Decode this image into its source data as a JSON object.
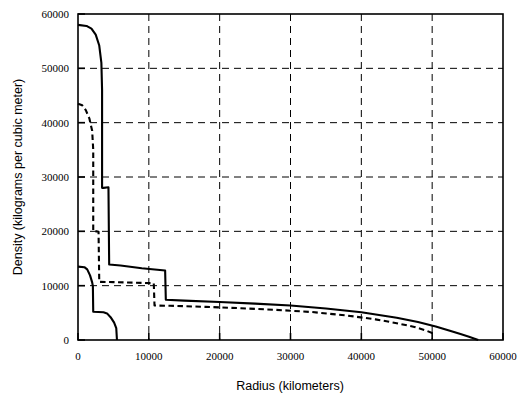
{
  "chart_data": {
    "type": "line",
    "title": "",
    "xlabel": "Radius (kilometers)",
    "ylabel": "Density  (kilograms per cubic meter)",
    "xlim": [
      0,
      60000
    ],
    "ylim": [
      0,
      60000
    ],
    "xticks": [
      0,
      10000,
      20000,
      30000,
      40000,
      50000,
      60000
    ],
    "yticks": [
      0,
      10000,
      20000,
      30000,
      40000,
      50000,
      60000
    ],
    "xtick_labels": [
      "0",
      "10000",
      "20000",
      "30000",
      "40000",
      "50000",
      "60000"
    ],
    "ytick_labels": [
      "0",
      "10000",
      "20000",
      "30000",
      "40000",
      "50000",
      "60000"
    ],
    "grid": true,
    "grid_style": "dashed",
    "legend": "none",
    "series": [
      {
        "name": "solid-upper",
        "style": "solid",
        "color": "#000000",
        "points": [
          [
            0,
            58000
          ],
          [
            1200,
            57800
          ],
          [
            1900,
            57300
          ],
          [
            2500,
            56200
          ],
          [
            3000,
            54200
          ],
          [
            3300,
            51000
          ],
          [
            3400,
            46000
          ],
          [
            3400,
            28000
          ],
          [
            3600,
            28000
          ],
          [
            4300,
            28100
          ],
          [
            4400,
            13900
          ],
          [
            6000,
            13700
          ],
          [
            9000,
            13200
          ],
          [
            12300,
            12800
          ],
          [
            12400,
            7400
          ],
          [
            15000,
            7250
          ],
          [
            20000,
            7000
          ],
          [
            25000,
            6700
          ],
          [
            30000,
            6350
          ],
          [
            35000,
            5800
          ],
          [
            40000,
            5100
          ],
          [
            45000,
            4100
          ],
          [
            48000,
            3300
          ],
          [
            50500,
            2500
          ],
          [
            52500,
            1700
          ],
          [
            54000,
            1100
          ],
          [
            55200,
            600
          ],
          [
            56000,
            250
          ],
          [
            56400,
            60
          ],
          [
            56500,
            0
          ]
        ]
      },
      {
        "name": "dashed-middle",
        "style": "dashed",
        "color": "#000000",
        "points": [
          [
            0,
            43500
          ],
          [
            600,
            43200
          ],
          [
            1100,
            42300
          ],
          [
            1600,
            40800
          ],
          [
            2000,
            38500
          ],
          [
            2150,
            35000
          ],
          [
            2150,
            20000
          ],
          [
            2600,
            20000
          ],
          [
            2900,
            19900
          ],
          [
            3000,
            10700
          ],
          [
            5000,
            10650
          ],
          [
            8000,
            10550
          ],
          [
            10700,
            10450
          ],
          [
            10800,
            6350
          ],
          [
            13000,
            6300
          ],
          [
            18000,
            6100
          ],
          [
            23000,
            5850
          ],
          [
            28000,
            5550
          ],
          [
            33000,
            5150
          ],
          [
            38000,
            4500
          ],
          [
            42000,
            3800
          ],
          [
            45000,
            3100
          ],
          [
            47500,
            2400
          ],
          [
            49000,
            1800
          ],
          [
            50000,
            1300
          ],
          [
            50500,
            1000
          ]
        ]
      },
      {
        "name": "solid-lower",
        "style": "solid",
        "color": "#000000",
        "points": [
          [
            0,
            13500
          ],
          [
            900,
            13400
          ],
          [
            1300,
            13000
          ],
          [
            1700,
            11900
          ],
          [
            2000,
            10600
          ],
          [
            2100,
            9900
          ],
          [
            2150,
            5200
          ],
          [
            3600,
            5100
          ],
          [
            4100,
            4900
          ],
          [
            4600,
            4200
          ],
          [
            5100,
            3200
          ],
          [
            5400,
            2200
          ],
          [
            5500,
            0
          ]
        ]
      }
    ]
  },
  "axes": {
    "x_title": "Radius (kilometers)",
    "y_title": "Density  (kilograms per cubic meter)"
  }
}
